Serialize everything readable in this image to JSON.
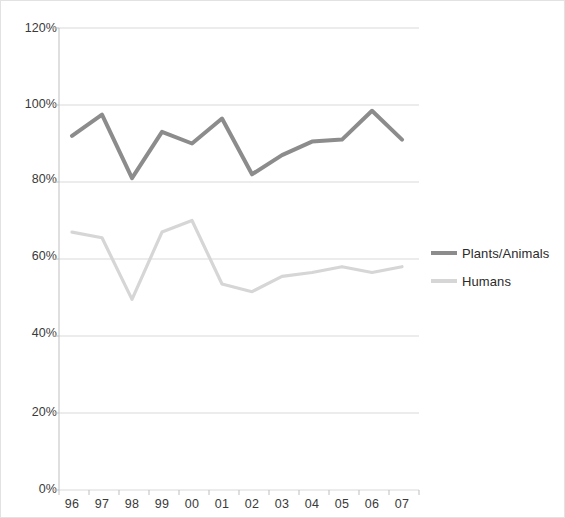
{
  "chart_data": {
    "type": "line",
    "title": "",
    "xlabel": "",
    "ylabel": "",
    "categories": [
      "96",
      "97",
      "98",
      "99",
      "00",
      "01",
      "02",
      "03",
      "04",
      "05",
      "06",
      "07"
    ],
    "series": [
      {
        "name": "Plants/Animals",
        "color": "#8c8c8c",
        "values": [
          92,
          97.5,
          81,
          93,
          90,
          96.5,
          82,
          87,
          90.5,
          91,
          98.5,
          91
        ]
      },
      {
        "name": "Humans",
        "color": "#d6d6d6",
        "values": [
          67,
          65.5,
          49.5,
          67,
          70,
          53.5,
          51.5,
          55.5,
          56.5,
          58,
          56.5,
          58
        ]
      }
    ],
    "ylim": [
      0,
      120
    ],
    "yticks": [
      0,
      20,
      40,
      60,
      80,
      100,
      120
    ],
    "ytick_labels": [
      "0%",
      "20%",
      "40%",
      "60%",
      "80%",
      "100%",
      "120%"
    ],
    "grid": true,
    "grid_axis": "y",
    "legend_position": "right",
    "value_suffix": "%"
  },
  "legend": {
    "entries": [
      {
        "label": "Plants/Animals"
      },
      {
        "label": "Humans"
      }
    ]
  },
  "axes": {
    "y_tick_labels": [
      "120%",
      "100%",
      "80%",
      "60%",
      "40%",
      "20%",
      "0%"
    ],
    "x_tick_labels": [
      "96",
      "97",
      "98",
      "99",
      "00",
      "01",
      "02",
      "03",
      "04",
      "05",
      "06",
      "07"
    ]
  },
  "colors": {
    "series_dark": "#8c8c8c",
    "series_light": "#d6d6d6",
    "gridline": "#d9d9d9",
    "axis": "#bfbfbf",
    "text": "#3a3a3a",
    "frame": "#e2e2e2"
  }
}
